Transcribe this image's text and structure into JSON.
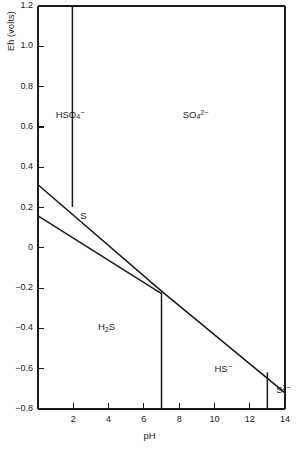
{
  "chart_data": {
    "type": "line",
    "title": "",
    "xlabel": "pH",
    "ylabel": "Eh (volts)",
    "xlim": [
      0,
      14
    ],
    "ylim": [
      -0.8,
      1.2
    ],
    "grid": false,
    "legend": "none",
    "xticks": [
      "2",
      "4",
      "6",
      "8",
      "10",
      "12",
      "14"
    ],
    "xtick_values": [
      2,
      4,
      6,
      8,
      10,
      12,
      14
    ],
    "yticks": [
      "1.2",
      "1.0",
      "0.8",
      "0.6",
      "0.4",
      "0.2",
      "0",
      "-0.2",
      "-0.4",
      "-0.6",
      "-0.8"
    ],
    "ytick_values": [
      1.2,
      1.0,
      0.8,
      0.6,
      0.4,
      0.2,
      0,
      -0.2,
      -0.4,
      -0.6,
      -0.8
    ],
    "series": [
      {
        "name": "HSO4-/SO4-2 boundary",
        "kind": "vertical-boundary",
        "points": [
          [
            1.95,
            1.2
          ],
          [
            1.95,
            0.203
          ]
        ]
      },
      {
        "name": "S/SO4-2 boundary",
        "kind": "sloped-boundary",
        "points": [
          [
            0,
            0.313
          ],
          [
            7.0,
            -0.215
          ],
          [
            14,
            -0.72
          ]
        ]
      },
      {
        "name": "H2S/S boundary",
        "kind": "sloped-boundary",
        "points": [
          [
            0,
            0.158
          ],
          [
            7.0,
            -0.228
          ]
        ]
      },
      {
        "name": "H2S/HS- boundary",
        "kind": "vertical-boundary",
        "points": [
          [
            7.0,
            -0.222
          ],
          [
            7.0,
            -0.8
          ]
        ]
      },
      {
        "name": "HS-/S-2 boundary",
        "kind": "vertical-boundary",
        "points": [
          [
            13.0,
            -0.618
          ],
          [
            13.0,
            -0.8
          ]
        ]
      }
    ],
    "annotations": [
      {
        "id": "hso4",
        "text": "HSO4-",
        "x": 1.0,
        "y": 0.66,
        "html": "HSO<sub>4</sub><sup>−</sup>"
      },
      {
        "id": "so4",
        "text": "SO4 2-",
        "x": 8.2,
        "y": 0.66,
        "html": "SO<sub>4</sub><sup>2−</sup>"
      },
      {
        "id": "s",
        "text": "S",
        "x": 2.4,
        "y": 0.155,
        "html": "S"
      },
      {
        "id": "h2s",
        "text": "H2S",
        "x": 3.4,
        "y": -0.4,
        "html": "H<sub>2</sub>S"
      },
      {
        "id": "hs",
        "text": "HS-",
        "x": 10.0,
        "y": -0.6,
        "html": "HS<sup>−</sup>"
      },
      {
        "id": "s2",
        "text": "S 2-",
        "x": 13.5,
        "y": -0.705,
        "html": "S<sup>2−</sup>"
      }
    ],
    "colors": {
      "axis": "#1a1a1a",
      "line": "#1a1a1a",
      "background": "#ffffff",
      "text": "#1a1a1a"
    }
  },
  "axes": {
    "y_title": "Eh (volts)",
    "x_title": "pH"
  }
}
